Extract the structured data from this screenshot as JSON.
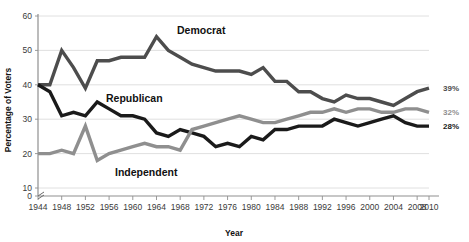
{
  "chart_data": {
    "type": "line",
    "title": "",
    "xlabel": "Year",
    "ylabel": "Percentage of Voters",
    "xlim": [
      1944,
      2010
    ],
    "ylim": [
      0,
      60
    ],
    "y_break": true,
    "grid": true,
    "legend_position": "inline-annotations",
    "yticks": [
      0,
      10,
      20,
      30,
      40,
      50,
      60
    ],
    "xticks": [
      1944,
      1948,
      1952,
      1956,
      1960,
      1964,
      1968,
      1972,
      1976,
      1980,
      1984,
      1988,
      1992,
      1996,
      2000,
      2004,
      2008,
      2010
    ],
    "x": [
      1944,
      1946,
      1948,
      1950,
      1952,
      1954,
      1956,
      1958,
      1960,
      1962,
      1964,
      1966,
      1968,
      1970,
      1972,
      1974,
      1976,
      1978,
      1980,
      1982,
      1984,
      1986,
      1988,
      1990,
      1992,
      1994,
      1996,
      1998,
      2000,
      2002,
      2004,
      2006,
      2008,
      2010
    ],
    "series": [
      {
        "name": "Democrat",
        "color": "#4d4d4d",
        "label": "Democrat",
        "end_label": "39%",
        "values": [
          40,
          40,
          50,
          45,
          39,
          47,
          47,
          48,
          48,
          48,
          54,
          50,
          48,
          46,
          45,
          44,
          44,
          44,
          43,
          45,
          41,
          41,
          38,
          38,
          36,
          35,
          37,
          36,
          36,
          35,
          34,
          36,
          38,
          39
        ]
      },
      {
        "name": "Republican",
        "color": "#1a1a1a",
        "label": "Republican",
        "end_label": "28%",
        "values": [
          40,
          38,
          31,
          32,
          31,
          35,
          33,
          31,
          31,
          30,
          26,
          25,
          27,
          26,
          25,
          22,
          23,
          22,
          25,
          24,
          27,
          27,
          28,
          28,
          28,
          30,
          29,
          28,
          29,
          30,
          31,
          29,
          28,
          28
        ]
      },
      {
        "name": "Independent",
        "color": "#8f8f8f",
        "label": "Independent",
        "end_label": "32%",
        "values": [
          20,
          20,
          21,
          20,
          28,
          18,
          20,
          21,
          22,
          23,
          22,
          22,
          21,
          27,
          28,
          29,
          30,
          31,
          30,
          29,
          29,
          30,
          31,
          32,
          32,
          33,
          32,
          33,
          33,
          32,
          32,
          33,
          33,
          32
        ]
      }
    ]
  },
  "axes": {
    "x_title": "Year",
    "y_title": "Percentage of Voters"
  }
}
